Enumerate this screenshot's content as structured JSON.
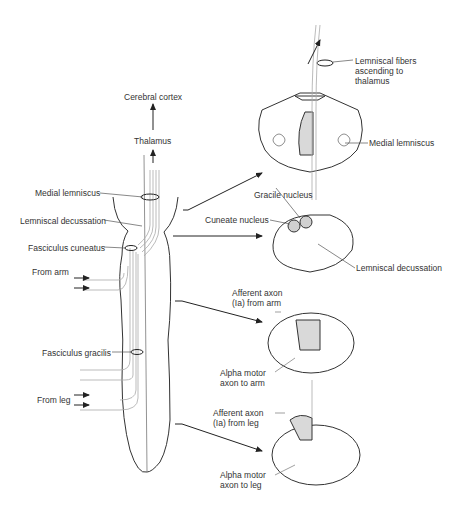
{
  "diagram": {
    "left_labels": {
      "cerebral_cortex": "Cerebral cortex",
      "thalamus": "Thalamus",
      "medial_lemniscus": "Medial lemniscus",
      "lemniscal_decussation": "Lemniscal decussation",
      "fasciculus_cuneatus": "Fasciculus cuneatus",
      "from_arm": "From arm",
      "fasciculus_gracilis": "Fasciculus gracilis",
      "from_leg": "From leg"
    },
    "right_labels": {
      "lemniscal_fibers": "Lemniscal fibers\nascending to\nthalamus",
      "medial_lemniscus": "Medial lemniscus",
      "gracile_nucleus": "Gracile nucleus",
      "cuneate_nucleus": "Cuneate nucleus",
      "lemniscal_decussation": "Lemniscal decussation",
      "afferent_arm": "Afferent axon\n(Ia) from arm",
      "alpha_arm": "Alpha motor\naxon to arm",
      "afferent_leg": "Afferent axon\n(Ia) from leg",
      "alpha_leg": "Alpha motor\naxon to leg"
    },
    "colors": {
      "line": "#333333",
      "fiber": "#9a9a9a",
      "shade": "#d9d9d9"
    }
  }
}
